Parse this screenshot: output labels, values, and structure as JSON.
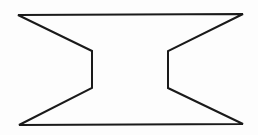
{
  "diagram": {
    "type": "polygon-outline",
    "shape": "hourglass-like concave octagon",
    "stroke_color": "#1a1a1a",
    "fill_color": "none",
    "background_color": "#fdfdfd",
    "stroke_width": 2,
    "vertices": [
      [
        18,
        15
      ],
      [
        243,
        14
      ],
      [
        168,
        51
      ],
      [
        168,
        88
      ],
      [
        243,
        124
      ],
      [
        19,
        125
      ],
      [
        92,
        88
      ],
      [
        92,
        51
      ]
    ]
  }
}
